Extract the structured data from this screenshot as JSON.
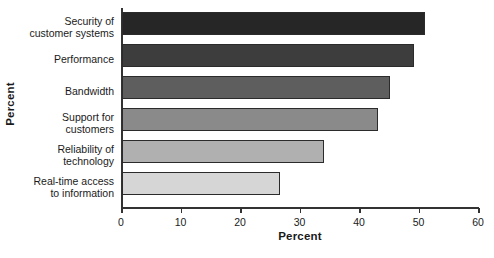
{
  "chart_data": {
    "type": "bar",
    "orientation": "horizontal",
    "title": "",
    "xlabel": "Percent",
    "ylabel": "Percent",
    "xlim": [
      0,
      60
    ],
    "xticks": [
      0,
      10,
      20,
      30,
      40,
      50,
      60
    ],
    "grid": false,
    "legend": null,
    "categories": [
      "Security of customer systems",
      "Performance",
      "Bandwidth",
      "Support for customers",
      "Reliability of technology",
      "Real-time access to information"
    ],
    "values": [
      51,
      49,
      45,
      43,
      34,
      26.5
    ],
    "bar_colors": [
      "#262626",
      "#3d3d3d",
      "#5e5e5e",
      "#8a8a8a",
      "#b0b0b0",
      "#d6d6d6"
    ],
    "bar_border_color": "#2b2b2b",
    "axis_color": "#333333",
    "background": "#ffffff",
    "bars": [
      {
        "label_lines": [
          "Security of",
          "customer systems"
        ],
        "value": 51,
        "color": "#262626"
      },
      {
        "label_lines": [
          "Performance"
        ],
        "value": 49,
        "color": "#3d3d3d"
      },
      {
        "label_lines": [
          "Bandwidth"
        ],
        "value": 45,
        "color": "#5e5e5e"
      },
      {
        "label_lines": [
          "Support for",
          "customers"
        ],
        "value": 43,
        "color": "#8a8a8a"
      },
      {
        "label_lines": [
          "Reliability of",
          "technology"
        ],
        "value": 34,
        "color": "#b0b0b0"
      },
      {
        "label_lines": [
          "Real-time access",
          "to information"
        ],
        "value": 26.5,
        "color": "#d6d6d6"
      }
    ],
    "tick_labels": [
      "0",
      "10",
      "20",
      "30",
      "40",
      "50",
      "60"
    ]
  }
}
